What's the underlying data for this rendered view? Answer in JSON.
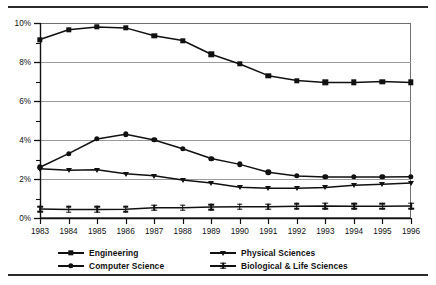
{
  "chart_data": {
    "type": "line",
    "title": "",
    "subtitle": "",
    "xlabel": "",
    "ylabel": "",
    "x": [
      1983,
      1984,
      1985,
      1986,
      1987,
      1988,
      1989,
      1990,
      1991,
      1992,
      1993,
      1994,
      1995,
      1996
    ],
    "categories": [
      "1983",
      "1984",
      "1985",
      "1986",
      "1987",
      "1988",
      "1989",
      "1990",
      "1991",
      "1992",
      "1993",
      "1994",
      "1995",
      "1996"
    ],
    "xtick_labels": [
      "1983",
      "1984",
      "1985",
      "1986",
      "1987",
      "1988",
      "1989",
      "1990",
      "1991",
      "1992",
      "1993",
      "1994",
      "1995",
      "1996"
    ],
    "ytick_labels": [
      "0%",
      "2%",
      "4%",
      "6%",
      "8%",
      "10%"
    ],
    "ytick_values": [
      0,
      2,
      4,
      6,
      8,
      10
    ],
    "yminor_values": [
      1,
      3,
      5,
      7,
      9
    ],
    "ylim": [
      0,
      10
    ],
    "xlim": [
      1983,
      1996
    ],
    "y_unit": "%",
    "grid": "horizontal-major",
    "legend_position": "bottom",
    "legend_columns": 2,
    "series": [
      {
        "name": "Engineering",
        "marker": "square",
        "values": [
          9.15,
          9.65,
          9.8,
          9.75,
          9.35,
          9.1,
          8.4,
          7.9,
          7.3,
          7.05,
          6.95,
          6.95,
          7.0,
          6.95
        ]
      },
      {
        "name": "Computer Science",
        "marker": "circle",
        "values": [
          2.6,
          3.3,
          4.05,
          4.3,
          4.0,
          3.55,
          3.05,
          2.75,
          2.35,
          2.15,
          2.1,
          2.1,
          2.1,
          2.12
        ]
      },
      {
        "name": "Physical Sciences",
        "marker": "triangle-down",
        "values": [
          2.52,
          2.45,
          2.48,
          2.27,
          2.17,
          1.95,
          1.8,
          1.58,
          1.52,
          1.53,
          1.57,
          1.68,
          1.73,
          1.8
        ]
      },
      {
        "name": "Biological & Life Sciences",
        "marker": "i-beam",
        "values": [
          0.46,
          0.44,
          0.44,
          0.45,
          0.52,
          0.53,
          0.56,
          0.58,
          0.58,
          0.6,
          0.62,
          0.6,
          0.6,
          0.62
        ]
      }
    ]
  },
  "legend": {
    "entries": [
      {
        "label": "Engineering",
        "marker": "square"
      },
      {
        "label": "Physical Sciences",
        "marker": "triangle-down"
      },
      {
        "label": "Computer Science",
        "marker": "circle"
      },
      {
        "label": "Biological & Life Sciences",
        "marker": "i-beam"
      }
    ]
  },
  "colors": {
    "ink": "#111111",
    "grid": "#9a9a9a",
    "frame": "#6f6f6f",
    "rule": "#2b2b2b",
    "background": "#ffffff"
  }
}
